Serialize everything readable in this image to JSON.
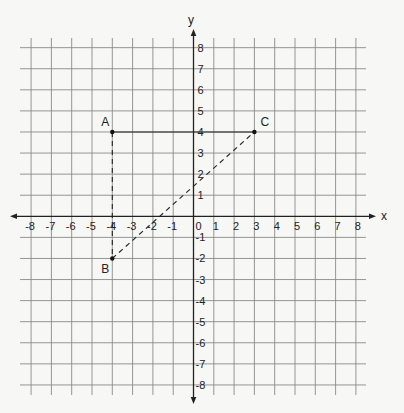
{
  "diagram": {
    "type": "coordinate-plane",
    "x_axis_label": "x",
    "y_axis_label": "y",
    "x_range": [
      -8,
      8
    ],
    "y_range": [
      -8,
      8
    ],
    "x_ticks": [
      "-8",
      "-7",
      "-6",
      "-5",
      "-4",
      "-3",
      "-2",
      "-1",
      "0",
      "1",
      "2",
      "3",
      "4",
      "5",
      "6",
      "7",
      "8"
    ],
    "y_ticks": [
      "8",
      "7",
      "6",
      "5",
      "4",
      "3",
      "2",
      "1",
      "-1",
      "-2",
      "-3",
      "-4",
      "-5",
      "-6",
      "-7",
      "-8"
    ],
    "points": [
      {
        "label": "A",
        "x": -4,
        "y": 4
      },
      {
        "label": "B",
        "x": -4,
        "y": -2
      },
      {
        "label": "C",
        "x": 3,
        "y": 4
      }
    ],
    "segments": [
      {
        "from": "A",
        "to": "C",
        "style": "solid"
      },
      {
        "from": "A",
        "to": "B",
        "style": "dashed"
      },
      {
        "from": "B",
        "to": "C",
        "style": "dashed"
      }
    ]
  }
}
